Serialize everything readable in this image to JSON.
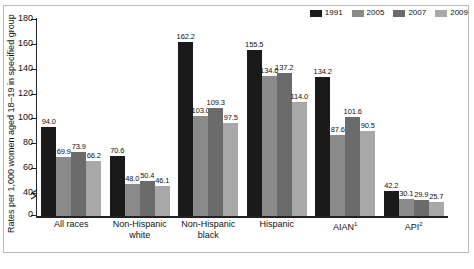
{
  "chart_data": {
    "type": "bar",
    "title": "",
    "subtitle": "",
    "xlabel": "",
    "ylabel": "Rates per 1,000 women aged 18–19 in specified group",
    "ylim": [
      0,
      180
    ],
    "y_ticks": [
      0,
      40,
      60,
      80,
      100,
      120,
      140,
      160,
      180
    ],
    "y_axis_break": true,
    "grid": false,
    "legend_position": "top-right",
    "categories": [
      "All races",
      "Non-Hispanic white",
      "Non-Hispanic black",
      "Hispanic",
      "AIAN¹",
      "API²"
    ],
    "series": [
      {
        "name": "1991",
        "color": "#1a1a1a",
        "values": [
          94.0,
          70.6,
          162.2,
          155.5,
          134.2,
          42.2
        ]
      },
      {
        "name": "2005",
        "color": "#8a8a8a",
        "values": [
          69.9,
          48.0,
          103.0,
          134.6,
          87.6,
          30.1
        ]
      },
      {
        "name": "2007",
        "color": "#6b6b6b",
        "values": [
          73.9,
          50.4,
          109.3,
          137.2,
          101.6,
          29.9
        ]
      },
      {
        "name": "2009",
        "color": "#a8a8a8",
        "values": [
          66.2,
          46.1,
          97.5,
          114.0,
          90.5,
          25.7
        ]
      }
    ]
  },
  "legend": {
    "items": [
      {
        "label": "1991",
        "color": "#1a1a1a"
      },
      {
        "label": "2005",
        "color": "#8a8a8a"
      },
      {
        "label": "2007",
        "color": "#6b6b6b"
      },
      {
        "label": "2009",
        "color": "#a8a8a8"
      }
    ]
  },
  "axes": {
    "y_title": "Rates per 1,000 women aged 18–19 in specified group",
    "y_tick_labels": [
      "0",
      "40",
      "60",
      "80",
      "100",
      "120",
      "140",
      "160",
      "180"
    ]
  },
  "x_labels": [
    {
      "line1": "All races",
      "line2": "",
      "sup": ""
    },
    {
      "line1": "Non-Hispanic",
      "line2": "white",
      "sup": ""
    },
    {
      "line1": "Non-Hispanic",
      "line2": "black",
      "sup": ""
    },
    {
      "line1": "Hispanic",
      "line2": "",
      "sup": ""
    },
    {
      "line1": "AIAN",
      "line2": "",
      "sup": "1"
    },
    {
      "line1": "API",
      "line2": "",
      "sup": "2"
    }
  ],
  "bar_labels": {
    "g0": [
      "94.0",
      "69.9",
      "73.9",
      "66.2"
    ],
    "g1": [
      "70.6",
      "48.0",
      "50.4",
      "46.1"
    ],
    "g2": [
      "162.2",
      "103.0",
      "109.3",
      "97.5"
    ],
    "g3": [
      "155.5",
      "134.6",
      "137.2",
      "114.0"
    ],
    "g4": [
      "134.2",
      "87.6",
      "101.6",
      "90.5"
    ],
    "g5": [
      "42.2",
      "30.1",
      "29.9",
      "25.7"
    ]
  },
  "footer": {
    "caption": ""
  }
}
